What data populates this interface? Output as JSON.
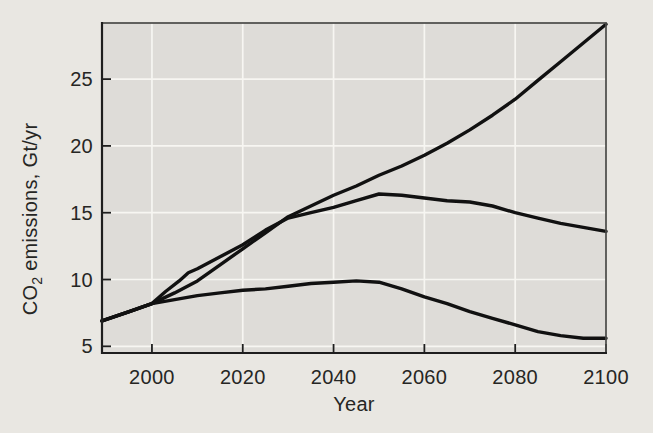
{
  "figure": {
    "background_color": "#e9e7e2",
    "plot_background_color": "#dedcd8",
    "grid_color": "#f7f6f2",
    "frame_color": "#4a4a48",
    "axis_color": "#1e1e1e",
    "line_color": "#111111",
    "text_color": "#262624"
  },
  "chart_data": {
    "type": "line",
    "title": "",
    "xlabel": "Year",
    "ylabel": "CO2 emissions, Gt/yr",
    "ylabel_parts": {
      "prefix": "CO",
      "subscript": "2",
      "suffix": " emissions, Gt/yr"
    },
    "xlim": [
      1989,
      2100
    ],
    "ylim": [
      4.5,
      29.2
    ],
    "xticks": [
      2000,
      2020,
      2040,
      2060,
      2080,
      2100
    ],
    "yticks": [
      5,
      10,
      15,
      20,
      25
    ],
    "grid": true,
    "legend": "none",
    "series": [
      {
        "name": "high-emissions-scenario",
        "x": [
          1989,
          1995,
          2000,
          2005,
          2010,
          2015,
          2020,
          2025,
          2030,
          2035,
          2040,
          2045,
          2050,
          2055,
          2060,
          2065,
          2070,
          2075,
          2080,
          2085,
          2090,
          2095,
          2100
        ],
        "values": [
          6.9,
          7.6,
          8.2,
          9.0,
          9.9,
          11.1,
          12.3,
          13.5,
          14.7,
          15.5,
          16.3,
          17.0,
          17.8,
          18.5,
          19.3,
          20.2,
          21.2,
          22.3,
          23.5,
          24.9,
          26.3,
          27.7,
          29.1
        ]
      },
      {
        "name": "mid-emissions-scenario",
        "x": [
          1989,
          1995,
          2000,
          2003,
          2006,
          2008,
          2010,
          2015,
          2020,
          2025,
          2030,
          2035,
          2040,
          2045,
          2050,
          2055,
          2060,
          2065,
          2070,
          2075,
          2080,
          2085,
          2090,
          2095,
          2100
        ],
        "values": [
          6.9,
          7.6,
          8.2,
          9.1,
          9.9,
          10.5,
          10.8,
          11.7,
          12.6,
          13.7,
          14.6,
          15.0,
          15.4,
          15.9,
          16.4,
          16.3,
          16.1,
          15.9,
          15.8,
          15.5,
          15.0,
          14.6,
          14.2,
          13.9,
          13.6
        ]
      },
      {
        "name": "low-emissions-scenario",
        "x": [
          1989,
          1995,
          2000,
          2005,
          2010,
          2015,
          2020,
          2025,
          2030,
          2035,
          2040,
          2045,
          2050,
          2055,
          2060,
          2065,
          2070,
          2075,
          2080,
          2085,
          2090,
          2095,
          2100
        ],
        "values": [
          6.9,
          7.6,
          8.2,
          8.5,
          8.8,
          9.0,
          9.2,
          9.3,
          9.5,
          9.7,
          9.8,
          9.9,
          9.8,
          9.3,
          8.7,
          8.2,
          7.6,
          7.1,
          6.6,
          6.1,
          5.8,
          5.6,
          5.6
        ]
      }
    ]
  },
  "layout": {
    "plot": {
      "left": 102,
      "top": 23,
      "right": 606,
      "bottom": 353
    }
  }
}
